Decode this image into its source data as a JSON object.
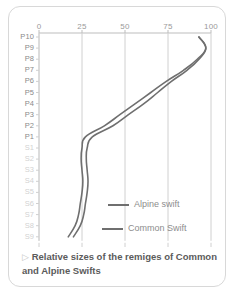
{
  "caption": {
    "marker": "▷",
    "line1": "Relative sizes of the remiges of",
    "line2": "Common and Alpine Swifts"
  },
  "colors": {
    "alpine": "#6f6f6f",
    "common": "#6f6f6f",
    "grid": "#d0d0d0",
    "axis": "#bdbdbd",
    "primary_label": "#8a8a8a",
    "secondary_label": "#d2d2d2",
    "card_border": "#d8d8d8",
    "background": "#ffffff"
  },
  "legend": {
    "position": "inside-bottom-center",
    "entries": [
      {
        "label": "Alpine swift",
        "color": "#6f6f6f"
      },
      {
        "label": "Common Swift",
        "color": "#6f6f6f"
      }
    ]
  },
  "chart_data": {
    "type": "line",
    "title": "",
    "subtitle": "",
    "xlabel": "",
    "ylabel": "",
    "orientation": "horizontal-value-vertical-category",
    "grid": true,
    "xlim": [
      0,
      100
    ],
    "xticks": [
      0,
      25,
      50,
      75,
      100
    ],
    "xtick_labels": [
      "0",
      "25",
      "50",
      "75",
      "100"
    ],
    "categories": [
      "P10",
      "P9",
      "P8",
      "P7",
      "P6",
      "P5",
      "P4",
      "P3",
      "P2",
      "P1",
      "S1",
      "S2",
      "S3",
      "S4",
      "S5",
      "S6",
      "S7",
      "S8",
      "S9"
    ],
    "category_groups": {
      "primaries": [
        "P10",
        "P9",
        "P8",
        "P7",
        "P6",
        "P5",
        "P4",
        "P3",
        "P2",
        "P1"
      ],
      "secondaries": [
        "S1",
        "S2",
        "S3",
        "S4",
        "S5",
        "S6",
        "S7",
        "S8",
        "S9"
      ]
    },
    "series": [
      {
        "name": "Alpine swift",
        "color": "#6f6f6f",
        "values": [
          93,
          97,
          92,
          84,
          74,
          65,
          56,
          47,
          38,
          27,
          25,
          24.5,
          25,
          25.5,
          25,
          24,
          23,
          21,
          17
        ]
      },
      {
        "name": "Common Swift",
        "color": "#6f6f6f",
        "values": [
          93,
          97,
          93,
          86,
          77,
          69,
          61,
          52,
          43,
          31,
          28,
          27.5,
          28,
          28.5,
          28,
          27,
          26,
          24,
          20
        ]
      }
    ]
  }
}
